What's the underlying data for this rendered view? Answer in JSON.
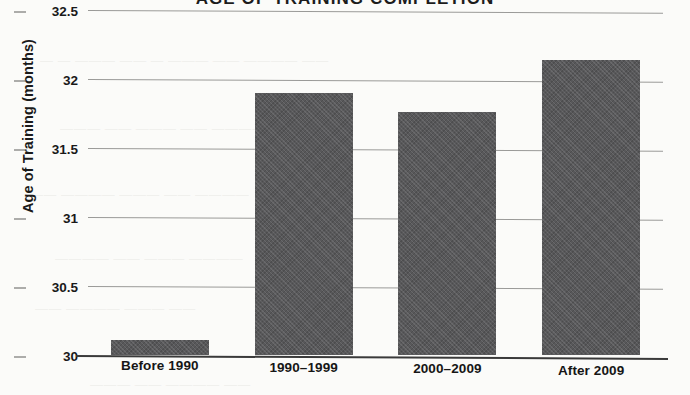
{
  "chart_data": {
    "type": "bar",
    "title": "AGE OF TRAINING COMPLETION",
    "title_note": "title is cropped by the top edge of the scanned page; only the lower halves of the capital letters are visible",
    "xlabel": "",
    "ylabel": "Age of Training (months)",
    "categories": [
      "Before 1990",
      "1990–1999",
      "2000–2009",
      "After 2009"
    ],
    "values": [
      30.11,
      31.9,
      31.76,
      32.14
    ],
    "ylim": [
      30,
      32.5
    ],
    "yticks": [
      30,
      30.5,
      31,
      31.5,
      32,
      32.5
    ],
    "ytick_labels": [
      "30",
      "30.5",
      "31",
      "31.5",
      "32",
      "32.5"
    ],
    "grid": true,
    "grid_axis": "y",
    "legend": false,
    "bar_color": "#58585a",
    "background_color": "#fbfbf9",
    "axis_color": "#3a3a3a",
    "gridline_color": "#9a9a98"
  },
  "axes": {
    "y_title": "Age of Training (months)",
    "y_ticks": [
      {
        "label": "32.5",
        "value": 32.5
      },
      {
        "label": "32",
        "value": 32
      },
      {
        "label": "31.5",
        "value": 31.5
      },
      {
        "label": "31",
        "value": 31
      },
      {
        "label": "30.5",
        "value": 30.5
      },
      {
        "label": "30",
        "value": 30
      }
    ],
    "x_ticks": [
      {
        "label": "Before 1990"
      },
      {
        "label": "1990–1999"
      },
      {
        "label": "2000–2009"
      },
      {
        "label": "After 2009"
      }
    ]
  },
  "bars": [
    {
      "label": "Before 1990",
      "value": 30.11
    },
    {
      "label": "1990–1999",
      "value": 31.9
    },
    {
      "label": "2000–2009",
      "value": 31.76
    },
    {
      "label": "After 2009",
      "value": 32.14
    }
  ],
  "title": {
    "text": "AGE OF TRAINING COMPLETION"
  },
  "artifacts": {
    "bleed_1": "— —  ———   ——  — ——— ——  ———— ——",
    "bleed_2": "———  —— ———  —— ——————",
    "bleed_3": "—— ————  ———  —— ————",
    "bleed_4": "———— ——  ——— ————",
    "bleed_5": "——  ———— ———  ——",
    "bleed_6": "——— ——  ———— ——"
  }
}
